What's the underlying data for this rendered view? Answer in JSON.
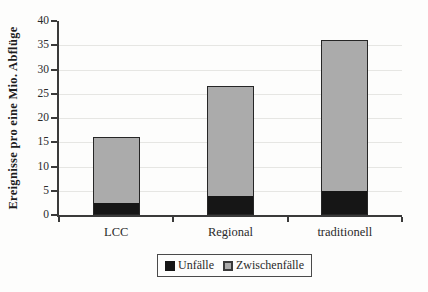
{
  "chart_data": {
    "type": "bar",
    "stacked": true,
    "title": "",
    "xlabel": "",
    "ylabel": "Ereignisse pro eine Mio. Abflüge",
    "ylim": [
      0,
      40
    ],
    "ytick_step": 5,
    "grid": true,
    "legend_position": "bottom",
    "categories": [
      "LCC",
      "Regional",
      "traditionell"
    ],
    "series": [
      {
        "name": "Unfälle",
        "color": "#161616",
        "values": [
          2.5,
          4,
          5
        ]
      },
      {
        "name": "Zwischenfälle",
        "color": "#ababab",
        "values": [
          13.5,
          22.5,
          31
        ]
      }
    ],
    "totals": [
      16,
      26.5,
      36
    ]
  }
}
